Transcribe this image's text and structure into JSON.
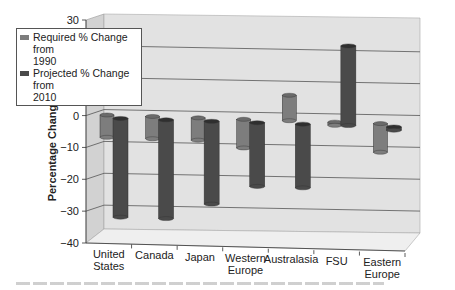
{
  "chart_data": {
    "type": "bar",
    "style": "3d-cylinder",
    "title": "",
    "xlabel": "",
    "ylabel": "Percentage Change",
    "ylim": [
      -40,
      30
    ],
    "yticks": [
      -40,
      -30,
      -20,
      -10,
      0,
      10,
      20,
      30
    ],
    "ytick_labels": [
      "−40",
      "−30",
      "−20",
      "−10",
      "0",
      "10",
      "",
      "30"
    ],
    "grid": true,
    "legend_position": "top-left",
    "categories": [
      [
        "United",
        "States"
      ],
      [
        "Canada"
      ],
      [
        "Japan"
      ],
      [
        "Western",
        "Europe"
      ],
      [
        "Australasia"
      ],
      [
        "FSU"
      ],
      [
        "Eastern",
        "Europe"
      ]
    ],
    "series": [
      {
        "name": "Required % Change from 1990",
        "legend_lines": [
          "Required % Change from",
          "1990"
        ],
        "color": "#7d7d7d",
        "values": [
          -7,
          -7,
          -7,
          -9,
          8,
          -1,
          -9
        ]
      },
      {
        "name": "Projected % Change from 2010",
        "legend_lines": [
          "Projected % Change from",
          "2010"
        ],
        "color": "#4a4a4a",
        "values": [
          -31,
          -31,
          -26,
          -20,
          -20,
          25,
          -1
        ]
      }
    ]
  }
}
